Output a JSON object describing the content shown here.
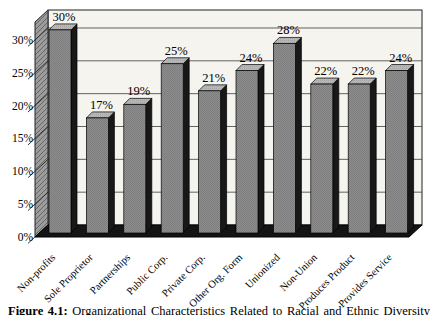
{
  "chart_data": {
    "type": "bar",
    "chart_style": "3d-column",
    "title": "",
    "xlabel": "",
    "ylabel": "",
    "categories": [
      "Non-profits",
      "Sole Proprietor",
      "Partnerships",
      "Public Corp.",
      "Private Corp.",
      "Other Org. Form",
      "Unionized",
      "Non-Union",
      "Produces Product",
      "Provides Service"
    ],
    "values": [
      30,
      17,
      19,
      25,
      21,
      24,
      28,
      22,
      22,
      24
    ],
    "data_labels": [
      "30%",
      "17%",
      "19%",
      "25%",
      "21%",
      "24%",
      "28%",
      "22%",
      "22%",
      "24%"
    ],
    "y_ticks": [
      "0%",
      "5%",
      "10%",
      "15%",
      "20%",
      "25%",
      "30%"
    ],
    "ylim": [
      0,
      30
    ],
    "grid": true,
    "legend": false,
    "colors": {
      "bar_front": "#8f8f8f",
      "bar_front_dot": "#7c7c7c",
      "bar_side": "#181818",
      "bar_top": "#b7b7b7",
      "bar_top_dot": "#a7a7a7",
      "bar_outline": "#000000",
      "back_wall": "#f5f4ef",
      "left_wall": "#9c9c9c",
      "left_wall_hatch": "#666666",
      "floor": "#141414",
      "gridline": "#3c3c3c",
      "frame": "#222222",
      "text": "#000000"
    }
  },
  "caption": {
    "label": "Figure 4.1:",
    "text": "Organizational Characteristics Related to Racial and Ethnic Diversity"
  }
}
